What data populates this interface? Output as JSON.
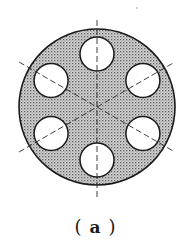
{
  "figure": {
    "caption": {
      "open": "(",
      "label": "a",
      "close": ")"
    },
    "disk": {
      "cx": 97,
      "cy": 107,
      "r": 78,
      "fill_color": "#c8c8c8",
      "dot_color": "#6e6e6e",
      "stroke_color": "#1a1a1a"
    },
    "holes": {
      "count": 6,
      "pitch_radius": 53,
      "r": 17,
      "angles_deg": [
        90,
        30,
        -30,
        -90,
        -150,
        150
      ],
      "fill_color": "#ffffff",
      "stroke_color": "#1a1a1a"
    },
    "center_lines": {
      "angles_deg": [
        90,
        30,
        -30
      ],
      "half_length": 90,
      "dash": "6 3",
      "stroke_color": "#2a2a2a"
    },
    "stray_mark": {
      "x": 137,
      "y": 8
    }
  }
}
